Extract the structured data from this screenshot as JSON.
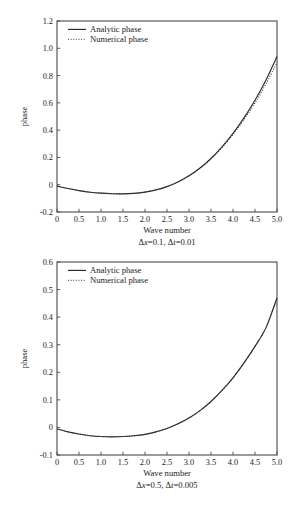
{
  "figure": {
    "background_color": "#ffffff",
    "line_color": "#2b2b2b",
    "axis_color": "#4a4a4a"
  },
  "chart_data": [
    {
      "type": "line",
      "title": "",
      "xlabel": "Wave number",
      "ylabel": "phase",
      "caption": "Δx=0.1, Δt=0.01",
      "caption_parts": {
        "dx_symbol": "Δ",
        "dx_var": "x",
        "dx_value": "=0.1,",
        "dt_symbol": "Δ",
        "dt_var": "t",
        "dt_value": "=0.01"
      },
      "xlim": [
        0,
        5
      ],
      "ylim": [
        -0.2,
        1.2
      ],
      "xticks": [
        "0",
        "0.5",
        "1.0",
        "1.5",
        "2.0",
        "2.5",
        "3.0",
        "3.5",
        "4.0",
        "4.5",
        "5.0"
      ],
      "xtick_values": [
        0,
        0.5,
        1.0,
        1.5,
        2.0,
        2.5,
        3.0,
        3.5,
        4.0,
        4.5,
        5.0
      ],
      "yticks": [
        "1.2",
        "1.0",
        "0.8",
        "0.6",
        "0.4",
        "0.2",
        "0",
        "-0.2"
      ],
      "ytick_values": [
        1.2,
        1.0,
        0.8,
        0.6,
        0.4,
        0.2,
        0,
        -0.2
      ],
      "grid": false,
      "legend_position": "top-left",
      "legend": [
        "Analytic phase",
        "Numerical phase"
      ],
      "x": [
        0,
        0.25,
        0.5,
        0.75,
        1.0,
        1.25,
        1.5,
        1.75,
        2.0,
        2.25,
        2.5,
        2.75,
        3.0,
        3.25,
        3.5,
        3.75,
        4.0,
        4.25,
        4.5,
        4.75,
        5.0
      ],
      "series": [
        {
          "name": "Analytic phase",
          "style": "solid",
          "values": [
            -0.01,
            -0.028,
            -0.043,
            -0.055,
            -0.062,
            -0.066,
            -0.067,
            -0.063,
            -0.054,
            -0.038,
            -0.014,
            0.02,
            0.065,
            0.122,
            0.192,
            0.277,
            0.376,
            0.49,
            0.619,
            0.768,
            0.94
          ]
        },
        {
          "name": "Numerical phase",
          "style": "dotted",
          "values": [
            -0.01,
            -0.028,
            -0.043,
            -0.055,
            -0.062,
            -0.066,
            -0.067,
            -0.063,
            -0.054,
            -0.038,
            -0.014,
            0.02,
            0.064,
            0.12,
            0.189,
            0.272,
            0.368,
            0.478,
            0.6,
            0.74,
            0.895
          ]
        }
      ]
    },
    {
      "type": "line",
      "title": "",
      "xlabel": "Wave number",
      "ylabel": "phase",
      "caption": "Δx=0.5, Δt=0.005",
      "caption_parts": {
        "dx_symbol": "Δ",
        "dx_var": "x",
        "dx_value": "=0.5,",
        "dt_symbol": "Δ",
        "dt_var": "t",
        "dt_value": "=0.005"
      },
      "xlim": [
        0,
        5
      ],
      "ylim": [
        -0.1,
        0.6
      ],
      "xticks": [
        "0",
        "0.5",
        "1.0",
        "1.5",
        "2.0",
        "2.5",
        "3.0",
        "3.5",
        "4.0",
        "4.5",
        "5.0"
      ],
      "xtick_values": [
        0,
        0.5,
        1.0,
        1.5,
        2.0,
        2.5,
        3.0,
        3.5,
        4.0,
        4.5,
        5.0
      ],
      "yticks": [
        "0.6",
        "0.5",
        "0.4",
        "0.3",
        "0.2",
        "0.1",
        "0",
        "-0.1"
      ],
      "ytick_values": [
        0.6,
        0.5,
        0.4,
        0.3,
        0.2,
        0.1,
        0,
        -0.1
      ],
      "grid": false,
      "legend_position": "top-left",
      "legend": [
        "Analytic phase",
        "Numerical phase"
      ],
      "x": [
        0,
        0.25,
        0.5,
        0.75,
        1.0,
        1.25,
        1.5,
        1.75,
        2.0,
        2.25,
        2.5,
        2.75,
        3.0,
        3.25,
        3.5,
        3.75,
        4.0,
        4.25,
        4.5,
        4.75,
        5.0
      ],
      "series": [
        {
          "name": "Analytic phase",
          "style": "solid",
          "values": [
            -0.005,
            -0.016,
            -0.024,
            -0.03,
            -0.033,
            -0.034,
            -0.033,
            -0.03,
            -0.025,
            -0.016,
            -0.004,
            0.013,
            0.034,
            0.061,
            0.094,
            0.134,
            0.18,
            0.234,
            0.294,
            0.362,
            0.47
          ]
        },
        {
          "name": "Numerical phase",
          "style": "dotted",
          "values": [
            -0.005,
            -0.016,
            -0.024,
            -0.03,
            -0.033,
            -0.034,
            -0.033,
            -0.03,
            -0.025,
            -0.016,
            -0.004,
            0.013,
            0.034,
            0.061,
            0.094,
            0.134,
            0.18,
            0.234,
            0.294,
            0.362,
            0.468
          ]
        }
      ]
    }
  ]
}
